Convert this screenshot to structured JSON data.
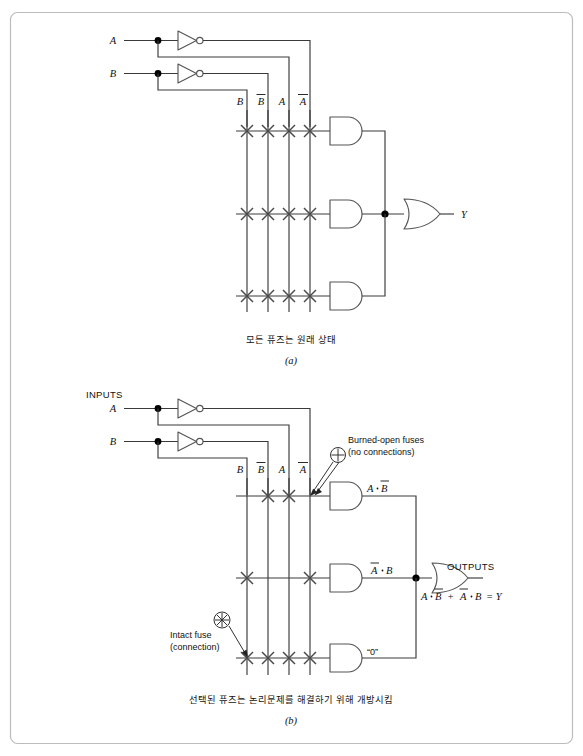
{
  "figure": {
    "title_absent": true,
    "border_color": "#bdbdbd",
    "wire_color": "#3a3a3a"
  },
  "panel_a": {
    "caption_ko": "모든 퓨즈는 원래 상태",
    "caption_letter": "(a)",
    "inputs": [
      {
        "name": "A"
      },
      {
        "name": "B"
      }
    ],
    "column_labels": [
      "B",
      "B",
      "A",
      "A"
    ],
    "column_labels_overbar": [
      false,
      true,
      false,
      true
    ],
    "output_label": "Y",
    "and_rows": [
      {
        "fuses": [
          "intact",
          "intact",
          "intact",
          "intact"
        ],
        "product_label": ""
      },
      {
        "fuses": [
          "intact",
          "intact",
          "intact",
          "intact"
        ],
        "product_label": ""
      },
      {
        "fuses": [
          "intact",
          "intact",
          "intact",
          "intact"
        ],
        "product_label": ""
      }
    ]
  },
  "panel_b": {
    "caption_ko": "선택된 퓨즈는 논리문제를 해결하기 위해 개방시킴",
    "caption_letter": "(b)",
    "inputs_header": "INPUTS",
    "inputs": [
      {
        "name": "A"
      },
      {
        "name": "B"
      }
    ],
    "column_labels": [
      "B",
      "B",
      "A",
      "A"
    ],
    "column_labels_overbar": [
      false,
      true,
      false,
      true
    ],
    "outputs_header": "OUTPUTS",
    "output_equation_parts": {
      "t1a": "A",
      "t1b": "B",
      "plus": "+",
      "t2a": "A",
      "t2b": "B",
      "equals": "= Y"
    },
    "annotations": [
      {
        "id": "burned-open",
        "line1": "Burned-open fuses",
        "line2": "(no connections)"
      },
      {
        "id": "intact",
        "line1": "Intact fuse",
        "line2": "(connection)"
      }
    ],
    "and_rows": [
      {
        "fuses": [
          "open",
          "intact",
          "intact",
          "open"
        ],
        "product_left": "A",
        "product_right": "B",
        "product_right_overbar": true,
        "product_left_overbar": false
      },
      {
        "fuses": [
          "intact",
          "open",
          "open",
          "intact"
        ],
        "product_left": "A",
        "product_right": "B",
        "product_left_overbar": true,
        "product_right_overbar": false
      },
      {
        "fuses": [
          "intact",
          "intact",
          "intact",
          "intact"
        ],
        "product_plain": "“0”"
      }
    ]
  }
}
